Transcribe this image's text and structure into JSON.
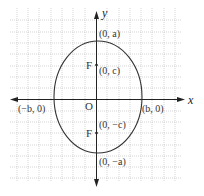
{
  "diagram": {
    "type": "ellipse-vertical-major-axis",
    "axes": {
      "x_label": "x",
      "y_label": "y",
      "origin_label": "O"
    },
    "ellipse": {
      "center": [
        0,
        0
      ],
      "semi_major_label": "a",
      "semi_minor_label": "b"
    },
    "points": {
      "top_vertex": "(0, a)",
      "bottom_vertex": "(0, −a)",
      "left_covertex": "(−b, 0)",
      "right_covertex": "(b, 0)",
      "focus_top": "(0, c)",
      "focus_bottom": "(0, −c)"
    },
    "focus_labels": {
      "top": "F",
      "bottom": "F"
    },
    "colors": {
      "curve": "#333333",
      "axis": "#222222",
      "grid": "#b8b8b8"
    }
  }
}
